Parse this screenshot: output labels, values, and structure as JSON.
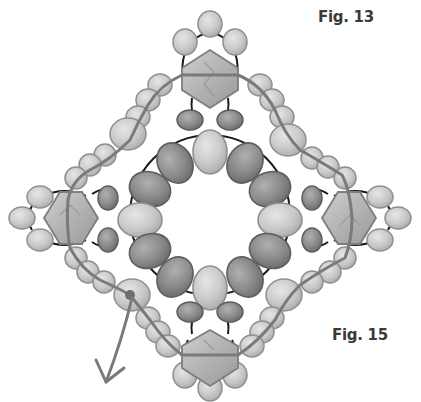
{
  "labels": {
    "fig_top": "Fig. 13",
    "fig_bottom": "Fig. 15"
  },
  "colors": {
    "background": "#ffffff",
    "light_bead": "#c8c8c8",
    "light_bead_stroke": "#8f8f8f",
    "dark_bead": "#8a8a8a",
    "dark_bead_stroke": "#5e5e5e",
    "bicone": "#b5b5b5",
    "bicone_stroke": "#7d7d7d",
    "thread": "#7a7a7a",
    "connector_thread": "#1a1a1a",
    "label_text": "#3a3a3a"
  },
  "diagram": {
    "center": [
      210,
      215
    ],
    "bicones": [
      {
        "name": "top",
        "cx": 210,
        "cy": 75
      },
      {
        "name": "left",
        "cx": 70,
        "cy": 218
      },
      {
        "name": "right",
        "cx": 352,
        "cy": 218
      },
      {
        "name": "bottom",
        "cx": 210,
        "cy": 357
      }
    ],
    "center_ring_radius": 72,
    "center_ring_beads": 12,
    "thread_start": [
      130,
      295
    ],
    "arrow_end": [
      105,
      380
    ]
  }
}
